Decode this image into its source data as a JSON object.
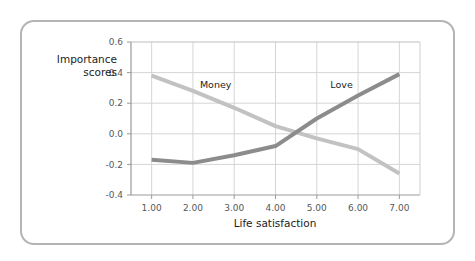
{
  "chart_data": {
    "type": "line",
    "title": "",
    "xlabel": "Life satisfaction",
    "ylabel": "Importance scores",
    "ylabel_line1": "Importance",
    "ylabel_line2": "scores",
    "x": [
      1,
      2,
      3,
      4,
      5,
      6,
      7
    ],
    "xticklabels": [
      "1.00",
      "2.00",
      "3.00",
      "4.00",
      "5.00",
      "6.00",
      "7.00"
    ],
    "yticklabels": [
      "0.6",
      "0.4",
      "0.2",
      "0.0",
      "-0.2",
      "-0.4"
    ],
    "yticks": [
      0.6,
      0.4,
      0.2,
      0.0,
      -0.2,
      -0.4
    ],
    "xlim": [
      0.5,
      7.5
    ],
    "ylim": [
      -0.4,
      0.6
    ],
    "grid": true,
    "legend_position": "inline-annotations",
    "series": [
      {
        "name": "Money",
        "color": "#c2c2c2",
        "label_x": 2.55,
        "label_y": 0.3,
        "values": [
          0.38,
          0.28,
          0.17,
          0.05,
          -0.03,
          -0.1,
          -0.26
        ]
      },
      {
        "name": "Love",
        "color": "#8c8c8c",
        "label_x": 5.6,
        "label_y": 0.3,
        "values": [
          -0.17,
          -0.19,
          -0.14,
          -0.08,
          0.1,
          0.25,
          0.39
        ]
      }
    ],
    "annotations": [
      {
        "text": "Money",
        "x": 2.55,
        "y": 0.3
      },
      {
        "text": "Love",
        "x": 5.6,
        "y": 0.3
      }
    ],
    "colors": {
      "money_line": "#c2c2c2",
      "love_line": "#8c8c8c",
      "grid": "#d5d5d5",
      "axis": "#9a9a9a",
      "frame_border": "#b4b4b4",
      "text": "#1c1c1c",
      "tick_text": "#55595c",
      "background": "#ffffff"
    }
  }
}
